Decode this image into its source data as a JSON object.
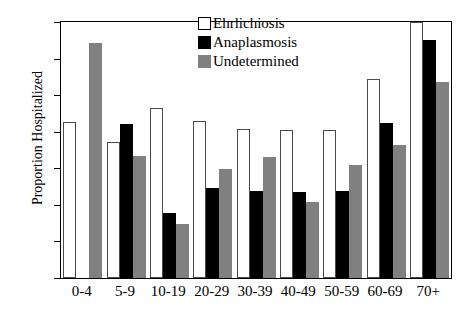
{
  "chart_data": {
    "type": "bar",
    "title": "",
    "xlabel": "",
    "ylabel": "Proportion Hospitalized",
    "ylim": [
      0,
      70
    ],
    "yticks": [
      0,
      10,
      20,
      30,
      40,
      50,
      60,
      70
    ],
    "grid": false,
    "legend_position": "top-center",
    "categories": [
      "0-4",
      "5-9",
      "10-19",
      "20-29",
      "30-39",
      "40-49",
      "50-59",
      "60-69",
      "70+"
    ],
    "series": [
      {
        "name": "Ehrlichiosis",
        "color": "#ffffff",
        "values": [
          42.7,
          37.2,
          46.6,
          42.8,
          40.7,
          40.5,
          40.5,
          54.5,
          70.0
        ]
      },
      {
        "name": "Anaplasmosis",
        "color": "#000000",
        "values": [
          0.0,
          42.0,
          17.9,
          24.5,
          23.8,
          23.6,
          23.9,
          42.4,
          65.0
        ]
      },
      {
        "name": "Undetermined",
        "color": "#808080",
        "values": [
          64.2,
          33.4,
          14.8,
          29.7,
          33.0,
          20.8,
          30.8,
          36.5,
          53.6
        ]
      }
    ]
  },
  "legend": {
    "items": [
      {
        "label": "Ehrlichiosis",
        "swatch": "white"
      },
      {
        "label": "Anaplasmosis",
        "swatch": "black"
      },
      {
        "label": "Undetermined",
        "swatch": "gray"
      }
    ]
  }
}
